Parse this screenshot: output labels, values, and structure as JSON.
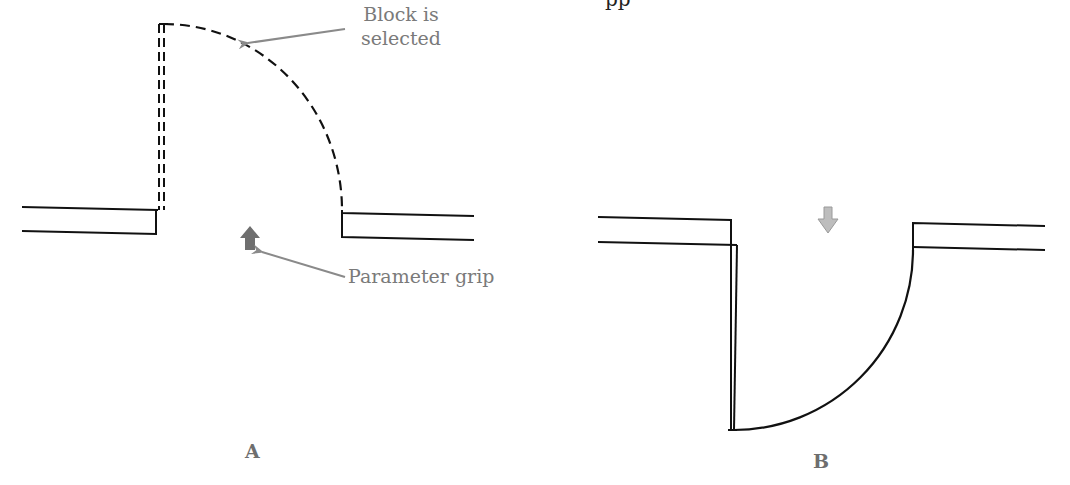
{
  "caption_fragment": "pp",
  "panels": [
    {
      "id": "A",
      "label": "A",
      "state": "Block is selected (dashed)",
      "annotations": {
        "block_selected": [
          "Block is",
          "selected"
        ],
        "parameter_grip": "Parameter grip"
      },
      "grip_direction": "up"
    },
    {
      "id": "B",
      "label": "B",
      "state": "Door flipped after grip click",
      "grip_direction": "down"
    }
  ],
  "colors": {
    "line": "#111111",
    "annotation": "#7a7a7a",
    "grip_a": "#6f6f6f",
    "grip_b": "#bdbdbd"
  }
}
